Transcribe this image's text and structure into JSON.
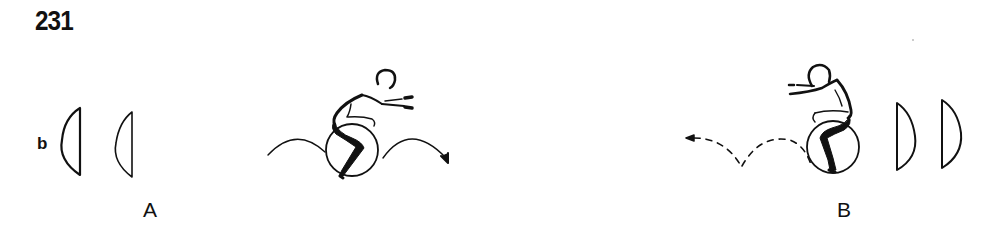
{
  "figure": {
    "number": "231",
    "row_label": "b",
    "colors": {
      "ink": "#111111",
      "background": "#ffffff"
    },
    "panels": [
      {
        "id": "A",
        "label": "A",
        "description": "Person seated on a gym ball, arms reaching forward to the right; solid arcs show rolling/bouncing motion to the right",
        "lenses": [
          {
            "flat_side": "right",
            "bulge": "left",
            "position": "left-outer"
          },
          {
            "flat_side": "right",
            "bulge": "left",
            "position": "left-inner"
          }
        ],
        "motion_arrows": {
          "style": "solid",
          "direction": "right",
          "count": 2,
          "arrow_icon": "arrow-right-icon"
        }
      },
      {
        "id": "B",
        "label": "B",
        "description": "Person seated on a gym ball, arms reaching forward to the left; dashed arcs show rolling/bouncing motion to the left",
        "lenses": [
          {
            "flat_side": "left",
            "bulge": "right",
            "position": "right-inner"
          },
          {
            "flat_side": "left",
            "bulge": "right",
            "position": "right-outer"
          }
        ],
        "motion_arrows": {
          "style": "dashed",
          "direction": "left",
          "count": 2,
          "arrow_icon": "arrow-left-icon"
        }
      }
    ]
  }
}
